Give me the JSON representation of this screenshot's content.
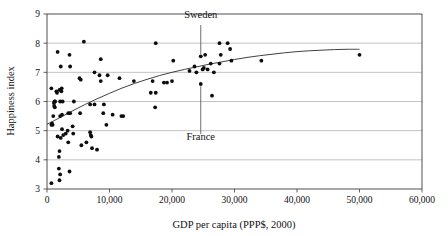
{
  "chart_data": {
    "type": "scatter",
    "title": "",
    "xlabel": "GDP per capita (PPP$, 2000)",
    "ylabel": "Happiness index",
    "xlim": [
      0,
      60000
    ],
    "ylim": [
      3,
      9
    ],
    "xticks": [
      0,
      10000,
      20000,
      30000,
      40000,
      50000,
      60000
    ],
    "xticklabels": [
      "0",
      "10,000",
      "20,000",
      "30,000",
      "40,000",
      "50,000",
      "60,000"
    ],
    "yticks": [
      3,
      4,
      5,
      6,
      7,
      8,
      9
    ],
    "yticklabels": [
      "3",
      "4",
      "5",
      "6",
      "7",
      "8",
      "9"
    ],
    "grid": "horizontal",
    "legend": "none",
    "marker_color": "#0d0d0d",
    "trendline_color": "#2b2b2b",
    "gridline_color": "#a8a8a8",
    "points": [
      [
        700,
        3.2
      ],
      [
        1900,
        3.7
      ],
      [
        2100,
        3.5
      ],
      [
        2000,
        3.3
      ],
      [
        3600,
        3.6
      ],
      [
        1900,
        4.1
      ],
      [
        2000,
        4.3
      ],
      [
        3400,
        4.6
      ],
      [
        7200,
        4.4
      ],
      [
        8000,
        4.35
      ],
      [
        5500,
        4.5
      ],
      [
        6300,
        4.6
      ],
      [
        1700,
        4.8
      ],
      [
        2200,
        4.75
      ],
      [
        2600,
        4.85
      ],
      [
        3000,
        4.9
      ],
      [
        4200,
        4.9
      ],
      [
        7000,
        4.85
      ],
      [
        7100,
        4.8
      ],
      [
        6900,
        4.95
      ],
      [
        2400,
        5.05
      ],
      [
        4100,
        5.15
      ],
      [
        3300,
        5.0
      ],
      [
        9500,
        5.2
      ],
      [
        700,
        5.2
      ],
      [
        800,
        5.25
      ],
      [
        900,
        5.2
      ],
      [
        1000,
        5.5
      ],
      [
        2100,
        5.5
      ],
      [
        2400,
        5.55
      ],
      [
        3400,
        5.6
      ],
      [
        3700,
        5.6
      ],
      [
        5300,
        5.6
      ],
      [
        9000,
        5.6
      ],
      [
        10500,
        5.55
      ],
      [
        12200,
        5.5
      ],
      [
        11900,
        5.5
      ],
      [
        17300,
        5.8
      ],
      [
        6900,
        5.9
      ],
      [
        7600,
        5.9
      ],
      [
        9100,
        5.9
      ],
      [
        1100,
        5.95
      ],
      [
        1200,
        6.0
      ],
      [
        1300,
        6.0
      ],
      [
        2100,
        6.0
      ],
      [
        2500,
        6.0
      ],
      [
        4300,
        6.0
      ],
      [
        1150,
        5.85
      ],
      [
        1250,
        5.8
      ],
      [
        16600,
        6.3
      ],
      [
        17400,
        6.3
      ],
      [
        1600,
        6.3
      ],
      [
        1500,
        6.35
      ],
      [
        700,
        6.45
      ],
      [
        2000,
        6.4
      ],
      [
        2300,
        6.35
      ],
      [
        2350,
        6.45
      ],
      [
        8600,
        6.7
      ],
      [
        11600,
        6.8
      ],
      [
        5200,
        6.8
      ],
      [
        5400,
        6.75
      ],
      [
        13900,
        6.7
      ],
      [
        16900,
        6.7
      ],
      [
        19200,
        6.65
      ],
      [
        20000,
        6.7
      ],
      [
        18700,
        6.65
      ],
      [
        24600,
        6.6
      ],
      [
        26400,
        6.2
      ],
      [
        8400,
        6.9
      ],
      [
        9700,
        6.9
      ],
      [
        7600,
        7.0
      ],
      [
        23900,
        7.0
      ],
      [
        26700,
        7.0
      ],
      [
        2200,
        7.2
      ],
      [
        3700,
        7.2
      ],
      [
        23600,
        7.2
      ],
      [
        24900,
        7.1
      ],
      [
        25700,
        7.1
      ],
      [
        25100,
        7.15
      ],
      [
        22800,
        7.05
      ],
      [
        26200,
        7.3
      ],
      [
        27600,
        7.3
      ],
      [
        29500,
        7.4
      ],
      [
        34300,
        7.4
      ],
      [
        20200,
        7.4
      ],
      [
        8600,
        7.45
      ],
      [
        3600,
        7.6
      ],
      [
        27800,
        7.6
      ],
      [
        50000,
        7.6
      ],
      [
        25300,
        7.6
      ],
      [
        24600,
        7.55
      ],
      [
        1700,
        7.7
      ],
      [
        29300,
        7.8
      ],
      [
        5900,
        8.05
      ],
      [
        17400,
        8.0
      ],
      [
        27600,
        8.0
      ],
      [
        28900,
        8.0
      ]
    ],
    "trendline": [
      [
        0,
        5.22
      ],
      [
        2000,
        5.44
      ],
      [
        4000,
        5.67
      ],
      [
        6000,
        5.89
      ],
      [
        8000,
        6.09
      ],
      [
        10000,
        6.28
      ],
      [
        12000,
        6.46
      ],
      [
        14000,
        6.62
      ],
      [
        16000,
        6.76
      ],
      [
        18000,
        6.89
      ],
      [
        20000,
        7.0
      ],
      [
        22000,
        7.1
      ],
      [
        24000,
        7.19
      ],
      [
        26000,
        7.28
      ],
      [
        28000,
        7.36
      ],
      [
        30000,
        7.44
      ],
      [
        32000,
        7.51
      ],
      [
        34000,
        7.57
      ],
      [
        36000,
        7.62
      ],
      [
        38000,
        7.67
      ],
      [
        40000,
        7.71
      ],
      [
        42000,
        7.74
      ],
      [
        44000,
        7.76
      ],
      [
        46000,
        7.78
      ],
      [
        48000,
        7.79
      ],
      [
        50000,
        7.79
      ]
    ],
    "annotations": [
      {
        "label": "Sweden",
        "label_x": 24600,
        "label_y": 8.86,
        "point_x": 24600,
        "point_y": 7.55,
        "leader_from_y": 8.62,
        "leader_to_y": 7.62
      },
      {
        "label": "France",
        "label_x": 24600,
        "label_y": 4.68,
        "point_x": 24600,
        "point_y": 6.6,
        "leader_from_y": 4.88,
        "leader_to_y": 6.52
      }
    ]
  }
}
